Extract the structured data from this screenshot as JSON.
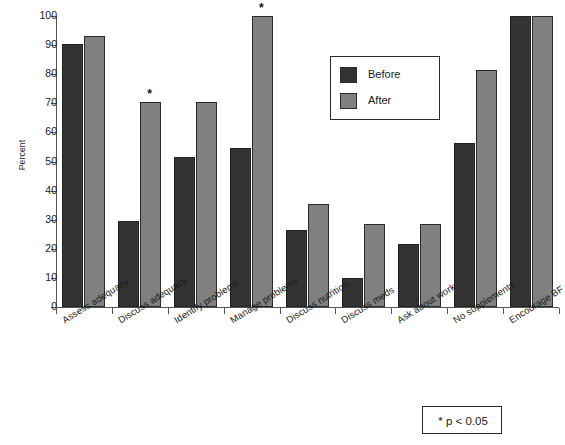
{
  "chart_data": {
    "type": "bar",
    "title": "",
    "xlabel": "",
    "ylabel": "Percent",
    "ylim": [
      0,
      100
    ],
    "ytick_step": 10,
    "yticks": [
      0,
      10,
      20,
      30,
      40,
      50,
      60,
      70,
      80,
      90,
      100
    ],
    "grid": false,
    "legend_position": "upper right",
    "categories": [
      "Assess adequacy",
      "Discuss adequacy",
      "Identify problems",
      "Manage problems",
      "Discuss nutrition",
      "Discuss meds",
      "Ask about work",
      "No supplements",
      "Encourage BF"
    ],
    "series": [
      {
        "name": "Before",
        "color": "#333333",
        "values": [
          90.5,
          29.5,
          51.5,
          54.5,
          26.5,
          10.0,
          21.5,
          56.5,
          100.0
        ]
      },
      {
        "name": "After",
        "color": "#808080",
        "values": [
          93.0,
          70.5,
          70.5,
          100.0,
          35.5,
          28.5,
          28.5,
          81.5,
          100.0
        ]
      }
    ],
    "annotations": {
      "significance_marker": "*",
      "significance_note": "* p < 0.05",
      "significant_categories": [
        "Discuss adequacy",
        "Manage problems"
      ]
    }
  },
  "legend": {
    "items": [
      {
        "label": "Before",
        "swatch": "dark-square-swatch"
      },
      {
        "label": "After",
        "swatch": "gray-square-swatch"
      }
    ]
  },
  "footnote": {
    "star": "*",
    "text": "p < 0.05",
    "full": "* p < 0.05"
  },
  "colors": {
    "before": "#333333",
    "after": "#808080",
    "axis": "#555555",
    "text": "#1a1a1a",
    "background": "#ffffff"
  }
}
